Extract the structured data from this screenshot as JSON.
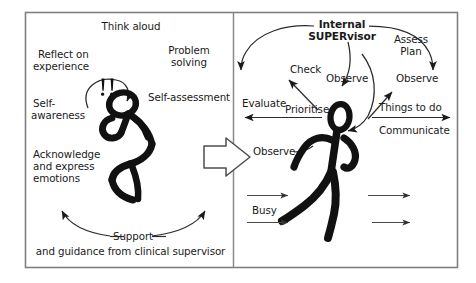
{
  "figure": {
    "panel_count": 2,
    "frame_color": "#808080",
    "ink_color": "#111111",
    "background": "#ffffff"
  },
  "left_panel": {
    "name": "Reflective practice panel",
    "figure_label": "seated thinking stick figure",
    "exclamation": "! !",
    "labels": {
      "think_aloud": "Think aloud",
      "reflect_line1": "Reflect on",
      "reflect_line2": "experience",
      "problem_line1": "Problem",
      "problem_line2": "solving",
      "self_aware_line1": "Self-",
      "self_aware_line2": "awareness",
      "self_assessment": "Self-assessment",
      "acknowledge_line1": "Acknowledge",
      "acknowledge_line2": "and express",
      "acknowledge_line3": "emotions",
      "support_line1": "Support",
      "support_line2": "and guidance from clinical supervisor"
    }
  },
  "right_panel": {
    "name": "Internal supervisor in action panel",
    "figure_label": "running stick figure",
    "labels": {
      "heading_line1": "Internal",
      "heading_line2": "SUPERvisor",
      "check": "Check",
      "observe_top": "Observe",
      "assess_line1": "Assess",
      "assess_line2": "Plan",
      "observe_right": "Observe",
      "evaluate": "Evaluate",
      "prioritise": "Prioritise",
      "things_to_do": "Things to do",
      "communicate": "Communicate",
      "observe_left": "Observe",
      "busy": "Busy"
    }
  },
  "transition": {
    "name": "block arrow from reflection to action",
    "direction": "right"
  }
}
